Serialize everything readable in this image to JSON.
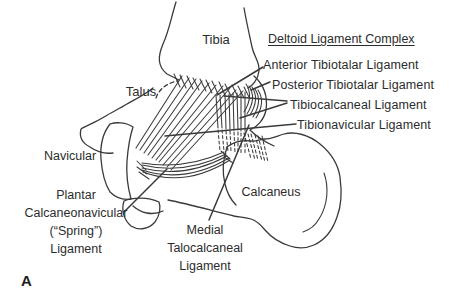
{
  "figure": {
    "panel_letter": "A",
    "title": "Deltoid Ligament Complex",
    "bone_labels": {
      "tibia": "Tibia",
      "talus": "Talus",
      "navicular": "Navicular",
      "calcaneus": "Calcaneus"
    },
    "ligament_labels": {
      "anterior_tibiotalar": "Anterior Tibiotalar Ligament",
      "posterior_tibiotalar": "Posterior Tibiotalar Ligament",
      "tibiocalcaneal": "Tibiocalcaneal Ligament",
      "tibionavicular": "Tibionavicular Ligament",
      "spring": {
        "lines": [
          "Plantar",
          "Calcaneonavicular",
          "(“Spring”)",
          "Ligament"
        ]
      },
      "medial_talocalcaneal": {
        "lines": [
          "Medial",
          "Talocalcaneal",
          "Ligament"
        ]
      }
    },
    "colors": {
      "ink_text": "#2c2c2c",
      "ink_stroke": "#3a3a3a",
      "background": "#ffffff"
    }
  }
}
